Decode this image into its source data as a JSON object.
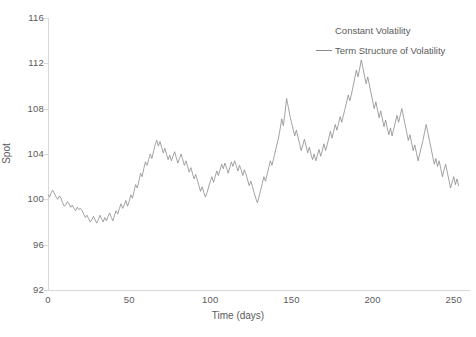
{
  "chart_data": {
    "type": "line",
    "title": "",
    "xlabel": "Time (days)",
    "ylabel": "Spot",
    "xlim": [
      0,
      260
    ],
    "ylim": [
      92,
      116
    ],
    "grid": false,
    "legend_position": "top-right",
    "x_ticks": [
      "0",
      "50",
      "100",
      "150",
      "200",
      "250"
    ],
    "x_tick_values": [
      0,
      50,
      100,
      150,
      200,
      250
    ],
    "y_ticks": [
      "92",
      "96",
      "100",
      "104",
      "108",
      "112",
      "116"
    ],
    "y_tick_values": [
      92,
      96,
      100,
      104,
      108,
      112,
      116
    ],
    "series": [
      {
        "name": "Constant Volatility",
        "color": "#8a8a8a",
        "visible": false,
        "values": []
      },
      {
        "name": "Term Structure of Volatility",
        "color": "#8a8a8a",
        "visible": true,
        "x_start": 0,
        "x_step": 1,
        "values": [
          100.4,
          100.2,
          100.6,
          100.8,
          100.5,
          100.2,
          100.0,
          100.3,
          100.1,
          99.7,
          99.4,
          99.5,
          99.8,
          99.6,
          99.3,
          99.5,
          99.2,
          99.0,
          99.3,
          99.1,
          99.2,
          99.0,
          98.7,
          98.4,
          98.6,
          98.3,
          98.0,
          98.2,
          98.5,
          98.2,
          97.9,
          98.2,
          98.6,
          98.3,
          98.0,
          98.4,
          98.1,
          98.5,
          98.8,
          98.4,
          98.1,
          98.6,
          99.0,
          98.7,
          99.2,
          99.6,
          99.2,
          99.5,
          99.9,
          99.4,
          99.8,
          100.4,
          100.1,
          100.7,
          101.3,
          101.0,
          101.6,
          102.3,
          102.0,
          102.7,
          103.3,
          103.0,
          103.5,
          104.0,
          103.6,
          104.2,
          104.8,
          105.2,
          104.7,
          105.1,
          104.6,
          104.1,
          104.5,
          104.0,
          103.5,
          103.9,
          103.4,
          103.8,
          104.2,
          103.7,
          103.2,
          103.6,
          104.0,
          103.5,
          103.0,
          103.4,
          102.9,
          102.4,
          102.8,
          102.3,
          101.8,
          102.2,
          101.7,
          101.2,
          100.7,
          101.1,
          100.6,
          100.2,
          100.6,
          101.1,
          101.6,
          102.0,
          101.5,
          102.0,
          102.5,
          102.1,
          102.6,
          103.1,
          102.7,
          103.2,
          102.8,
          102.3,
          102.8,
          103.3,
          102.9,
          103.4,
          103.0,
          102.5,
          103.0,
          102.6,
          102.1,
          102.6,
          102.2,
          101.7,
          101.2,
          101.6,
          101.1,
          100.6,
          100.1,
          99.7,
          100.2,
          100.8,
          101.4,
          102.0,
          101.6,
          102.2,
          102.8,
          103.4,
          103.0,
          103.6,
          104.2,
          104.8,
          105.4,
          106.2,
          107.1,
          106.5,
          107.6,
          108.9,
          108.2,
          107.4,
          106.8,
          106.2,
          105.6,
          106.1,
          105.5,
          104.9,
          104.3,
          104.8,
          105.3,
          104.7,
          104.1,
          104.6,
          104.0,
          103.5,
          104.0,
          103.4,
          103.9,
          104.4,
          103.8,
          104.3,
          104.9,
          104.3,
          104.8,
          105.4,
          106.0,
          105.4,
          106.0,
          106.6,
          106.1,
          106.7,
          107.3,
          106.8,
          107.4,
          108.0,
          108.6,
          109.2,
          108.7,
          109.3,
          110.0,
          110.7,
          111.4,
          110.8,
          111.5,
          112.3,
          111.6,
          110.9,
          110.2,
          110.8,
          110.1,
          109.4,
          108.7,
          108.0,
          108.6,
          107.9,
          107.2,
          107.8,
          107.1,
          106.4,
          107.0,
          106.3,
          105.7,
          106.3,
          105.6,
          106.2,
          106.8,
          107.4,
          106.8,
          107.4,
          108.0,
          107.3,
          106.6,
          105.9,
          105.2,
          105.7,
          105.0,
          104.3,
          104.8,
          104.1,
          103.4,
          104.0,
          104.6,
          105.2,
          105.9,
          106.6,
          105.9,
          105.2,
          104.5,
          103.8,
          103.1,
          103.6,
          102.9,
          103.4,
          102.7,
          102.0,
          102.6,
          103.1,
          102.4,
          101.7,
          101.0,
          101.5,
          102.0,
          101.3,
          101.8,
          101.2
        ]
      }
    ]
  },
  "legend": {
    "entries": [
      {
        "label": "Constant Volatility"
      },
      {
        "label": "Term Structure of Volatility"
      }
    ]
  },
  "axes": {
    "x_title": "Time (days)",
    "y_title": "Spot"
  },
  "colors": {
    "line": "#8a8a8a",
    "axis": "#d9d9d9",
    "text": "#5a5a5a",
    "background": "#ffffff"
  }
}
